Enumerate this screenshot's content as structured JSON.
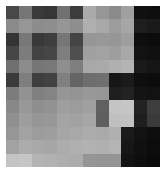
{
  "figure": {
    "width": 166,
    "height": 173,
    "background_color": "#ffffff",
    "margin": {
      "left": 6,
      "top": 6,
      "right": 6,
      "bottom": 6
    }
  },
  "chart_data": {
    "type": "heatmap",
    "title": "",
    "subtitle": "",
    "xlabel": "",
    "ylabel": "",
    "colormap": "gray",
    "grid": false,
    "legend": false,
    "legend_position": "none",
    "axis_visible": false,
    "tick_labels_visible": false,
    "rows": 12,
    "cols": 12,
    "x": [
      0,
      1,
      2,
      3,
      4,
      5,
      6,
      7,
      8,
      9,
      10,
      11
    ],
    "y": [
      0,
      1,
      2,
      3,
      4,
      5,
      6,
      7,
      8,
      9,
      10,
      11
    ],
    "xticklabels": [],
    "yticklabels": [],
    "vmin": 0,
    "vmax": 255,
    "annotations": [],
    "values": [
      [
        72,
        118,
        58,
        54,
        112,
        60,
        170,
        150,
        138,
        160,
        16,
        14
      ],
      [
        138,
        150,
        140,
        142,
        150,
        142,
        176,
        168,
        156,
        166,
        30,
        26
      ],
      [
        52,
        120,
        56,
        62,
        118,
        68,
        150,
        152,
        150,
        158,
        14,
        12
      ],
      [
        70,
        124,
        66,
        70,
        126,
        78,
        160,
        162,
        158,
        168,
        18,
        16
      ],
      [
        112,
        140,
        118,
        120,
        142,
        126,
        168,
        170,
        176,
        180,
        26,
        22
      ],
      [
        58,
        126,
        62,
        66,
        128,
        100,
        110,
        112,
        22,
        26,
        14,
        12
      ],
      [
        124,
        146,
        128,
        132,
        150,
        148,
        152,
        150,
        30,
        34,
        20,
        18
      ],
      [
        136,
        152,
        142,
        146,
        158,
        156,
        160,
        96,
        196,
        198,
        34,
        62
      ],
      [
        144,
        158,
        150,
        152,
        164,
        162,
        166,
        94,
        192,
        194,
        30,
        58
      ],
      [
        150,
        162,
        156,
        158,
        166,
        168,
        172,
        170,
        176,
        26,
        18,
        14
      ],
      [
        162,
        172,
        168,
        166,
        172,
        176,
        178,
        176,
        180,
        22,
        16,
        12
      ],
      [
        196,
        198,
        180,
        178,
        174,
        172,
        150,
        148,
        148,
        18,
        14,
        10
      ]
    ]
  }
}
